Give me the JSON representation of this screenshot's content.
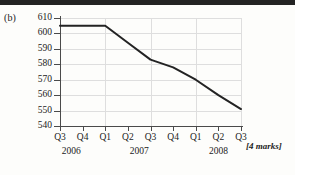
{
  "part_label": "(b)",
  "marks_label": "[4 marks]",
  "colors": {
    "line": "#232323",
    "grid": "#dedede",
    "axis": "#4a4a4a",
    "text": "#1a1a1a",
    "background": "#fdfdfb",
    "top_bar": "#232323"
  },
  "chart_data": {
    "type": "line",
    "title": "",
    "subtitle": "",
    "xlabel": "",
    "ylabel": "",
    "grid": true,
    "legend": "none",
    "categories": [
      "Q3",
      "Q4",
      "Q1",
      "Q2",
      "Q3",
      "Q4",
      "Q1",
      "Q2",
      "Q3"
    ],
    "year_groups": [
      {
        "label": "2006",
        "quarters": [
          "Q3",
          "Q4"
        ]
      },
      {
        "label": "2007",
        "quarters": [
          "Q1",
          "Q2",
          "Q3",
          "Q4"
        ]
      },
      {
        "label": "2008",
        "quarters": [
          "Q1",
          "Q2",
          "Q3"
        ]
      }
    ],
    "values": [
      605,
      605,
      605,
      594,
      583,
      578,
      570,
      560,
      551
    ],
    "ylim": [
      540,
      610
    ],
    "ytick_values": [
      610,
      600,
      590,
      580,
      570,
      560,
      550,
      540
    ],
    "ytick_labels": [
      "610",
      "600",
      "590",
      "580",
      "570",
      "560",
      "550",
      "540"
    ],
    "xtick_labels": [
      "Q3",
      "Q4",
      "Q1",
      "Q2",
      "Q3",
      "Q4",
      "Q1",
      "Q2",
      "Q3"
    ],
    "gridline_quarter_indices": [
      0,
      2,
      4,
      6,
      8
    ]
  }
}
